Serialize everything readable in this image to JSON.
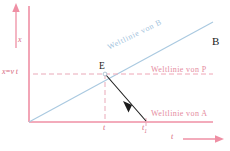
{
  "figure": {
    "page_letter": "B",
    "axes": {
      "x_axis_label": "x",
      "t_axis_label": "t",
      "origin_label": ""
    },
    "labels": {
      "x_equals_vt": "x=v t",
      "event_point": "E",
      "tick_t": "t",
      "tick_t1_base": "t",
      "tick_t1_sub": "1"
    },
    "worldlines": [
      {
        "name": "worldline-B",
        "label": "Weltlinie  von  B",
        "color": "#9fc3dd"
      },
      {
        "name": "worldline-P",
        "label": "Weltlinie  von  P",
        "color": "#e58ca0"
      },
      {
        "name": "worldline-A",
        "label": "Weltlinie  von  A",
        "color": "#e58ca0"
      }
    ],
    "colors": {
      "axis": "#ef8fa4",
      "axis_strong": "#e8798f",
      "worldline_b": "#a9c9e0",
      "worldline_p_dashed": "#efa6b6",
      "dashed_guide": "#e9a9b8",
      "signal_arrow": "#1c1c1c",
      "page_letter": "#1a1a1a",
      "background": "#ffffff"
    },
    "geometry": {
      "origin": [
        29,
        122
      ],
      "event_E": [
        105,
        74
      ],
      "t1_tick": [
        105,
        122
      ],
      "t2_tick": [
        146,
        122
      ],
      "b_line_end": [
        213,
        22
      ],
      "x_axis_top": [
        29,
        6
      ],
      "t_axis_right": [
        213,
        122
      ]
    }
  }
}
